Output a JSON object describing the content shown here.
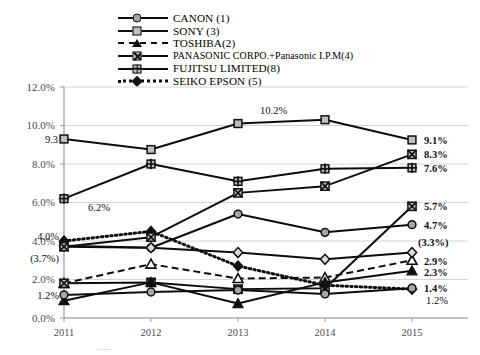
{
  "chart_data": {
    "type": "line",
    "title": "",
    "xlabel": "",
    "ylabel": "",
    "categories": [
      "2011",
      "2012",
      "2013",
      "2014",
      "2015"
    ],
    "ylim": [
      0,
      12
    ],
    "ytick_labels": [
      "0.0%",
      "2.0%",
      "4.0%",
      "6.0%",
      "8.0%",
      "10.0%",
      "12.0%"
    ],
    "ytick_values": [
      0,
      2,
      4,
      6,
      8,
      10,
      12
    ],
    "grid": true,
    "legend_position": "top",
    "series": [
      {
        "name": "CANON (1)",
        "legend_label": "CANON (1)",
        "marker": "circle",
        "line_style": "solid",
        "values": [
          3.7,
          3.65,
          5.4,
          4.45,
          4.85
        ],
        "end_label": "4.7%"
      },
      {
        "name": "SONY (3)",
        "legend_label": "SONY (3)",
        "marker": "square",
        "line_style": "solid",
        "values": [
          9.3,
          8.75,
          10.1,
          10.3,
          9.25
        ],
        "start_label": "9.3",
        "peak_label": "10.2%",
        "end_label": "9.1%"
      },
      {
        "name": "TOSHIBA(2)",
        "legend_label": "TOSHIBA(2)",
        "marker": "triangle-open",
        "line_style": "dashed",
        "values": [
          1.8,
          2.8,
          2.05,
          2.1,
          3.0
        ],
        "end_label": "2.9%"
      },
      {
        "name": "PANASONIC CORPO.+Panasonic I.P.M(4)",
        "legend_label": "PANASONIC CORPO.+Panasonic I.P.M(4)",
        "marker": "x-square",
        "line_style": "solid",
        "values": [
          1.8,
          1.85,
          1.5,
          1.55,
          5.8
        ],
        "end_label": "5.7%"
      },
      {
        "name": "FUJITSU LIMITED(8)",
        "legend_label": "FUJITSU LIMITED(8)",
        "marker": "plus-square",
        "line_style": "solid",
        "values": [
          6.2,
          8.0,
          7.1,
          7.75,
          7.8
        ],
        "start_label": "6.2%",
        "end_label": "7.6%"
      },
      {
        "name": "SEIKO EPSON (5)",
        "legend_label": "SEIKO EPSON (5)",
        "marker": "filled-diamond",
        "line_style": "dotted",
        "values": [
          4.0,
          4.5,
          2.7,
          1.7,
          1.5
        ],
        "start_label": "4.0%",
        "end_label": "1.4%"
      },
      {
        "name": "series-diamond-grey",
        "legend_label": "",
        "marker": "diamond",
        "line_style": "solid",
        "values": [
          3.75,
          3.65,
          3.4,
          3.05,
          3.4
        ],
        "start_label": "(3.7%)",
        "end_label": "(3.3%)"
      },
      {
        "name": "series-panasonic-rise",
        "legend_label": "",
        "marker": "x-square",
        "line_style": "solid",
        "values": [
          3.7,
          4.2,
          6.5,
          6.85,
          8.5
        ],
        "end_label": "8.3%"
      },
      {
        "name": "series-triangle-filled",
        "legend_label": "",
        "marker": "triangle-filled",
        "line_style": "solid",
        "values": [
          0.9,
          1.85,
          0.75,
          1.85,
          2.45
        ],
        "end_label": "2.3%"
      },
      {
        "name": "series-circle-low",
        "legend_label": "",
        "marker": "circle",
        "line_style": "solid",
        "values": [
          1.2,
          1.35,
          1.45,
          1.25,
          1.55
        ],
        "start_label": "1.2%",
        "end_label": "1.2%"
      }
    ],
    "left_labels": [
      "9.3",
      "6.2%",
      "4.0%",
      "(3.7%)",
      "1.2%"
    ],
    "right_labels": [
      "9.1%",
      "8.3%",
      "7.6%",
      "5.7%",
      "4.7%",
      "(3.3%)",
      "2.9%",
      "2.3%",
      "1.4%",
      "1.2%"
    ],
    "inner_labels": [
      "10.2%"
    ]
  },
  "legend": {
    "items": [
      {
        "label": "CANON (1)",
        "marker": "circle-icon",
        "line": "solid"
      },
      {
        "label": "SONY (3)",
        "marker": "square-icon",
        "line": "solid"
      },
      {
        "label": "TOSHIBA(2)",
        "marker": "triangle-icon",
        "line": "dashed"
      },
      {
        "label": "PANASONIC CORPO.+Panasonic I.P.M(4)",
        "marker": "x-square-icon",
        "line": "solid"
      },
      {
        "label": "FUJITSU LIMITED(8)",
        "marker": "plus-square-icon",
        "line": "solid"
      },
      {
        "label": "SEIKO EPSON (5)",
        "marker": "filled-diamond-icon",
        "line": "dotted"
      }
    ]
  },
  "axes": {
    "y_labels": [
      "12.0%",
      "10.0%",
      "8.0%",
      "6.0%",
      "4.0%",
      "2.0%",
      "0.0%"
    ],
    "x_labels": [
      "2011",
      "2012",
      "2013",
      "2014",
      "2015"
    ]
  },
  "data_labels": {
    "sony_2011": "9.3",
    "sony_2013": "10.2%",
    "sony_2015": "9.1%",
    "panasonic_rise_2015": "8.3%",
    "fujitsu_2011": "6.2%",
    "fujitsu_2015": "7.6%",
    "panasonic_2015": "5.7%",
    "canon_2015": "4.7%",
    "epson_2011": "4.0%",
    "diamond_2011": "(3.7%)",
    "diamond_2015": "(3.3%)",
    "toshiba_2015": "2.9%",
    "tri_2015": "2.3%",
    "epson_2015": "1.4%",
    "circle_low_2011": "1.2%",
    "circle_low_2015": "1.2%"
  },
  "caption": {
    "text": "......"
  },
  "colors": {
    "line": "#0d0d0d",
    "grid": "#d4d4d4",
    "axis_text": "#4d4d4d",
    "marker_fill_light": "#bfbfbf",
    "marker_fill_grey": "#a6a6a6"
  }
}
